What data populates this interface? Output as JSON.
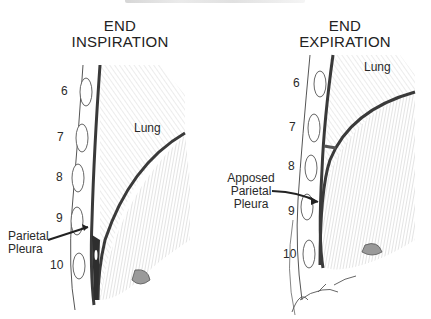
{
  "figure": {
    "top_text_cropped": "",
    "panels": [
      {
        "id": "inspiration",
        "title_line1": "END",
        "title_line2": "INSPIRATION",
        "ribs": [
          "6",
          "7",
          "8",
          "9",
          "10"
        ],
        "lung_label": "Lung",
        "pleura_label_line1": "Parietal",
        "pleura_label_line2": "Pleura"
      },
      {
        "id": "expiration",
        "title_line1": "END",
        "title_line2": "EXPIRATION",
        "ribs": [
          "6",
          "7",
          "8",
          "9",
          "10"
        ],
        "lung_label": "Lung",
        "pleura_label_line1": "Apposed",
        "pleura_label_line2": "Parietal",
        "pleura_label_line3": "Pleura"
      }
    ],
    "colors": {
      "ink": "#333333",
      "shade": "#d8d8d8",
      "background": "#ffffff"
    }
  }
}
